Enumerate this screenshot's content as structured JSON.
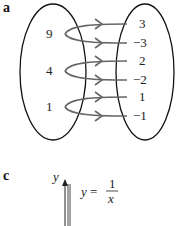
{
  "part_a": {
    "label": "a",
    "domain_values": [
      "9",
      "4",
      "1"
    ],
    "range_values": [
      "3",
      "−3",
      "2",
      "−2",
      "1",
      "−1"
    ],
    "mappings": [
      {
        "from": "9",
        "to": [
          "3",
          "−3"
        ]
      },
      {
        "from": "4",
        "to": [
          "2",
          "−2"
        ]
      },
      {
        "from": "1",
        "to": [
          "1",
          "−1"
        ]
      }
    ]
  },
  "part_c": {
    "label": "c",
    "axis_label_y": "y",
    "equation_lhs": "y =",
    "equation_num": "1",
    "equation_den": "x"
  },
  "colors": {
    "ellipse": "#111111",
    "arrow": "#666666",
    "text": "#222222"
  }
}
